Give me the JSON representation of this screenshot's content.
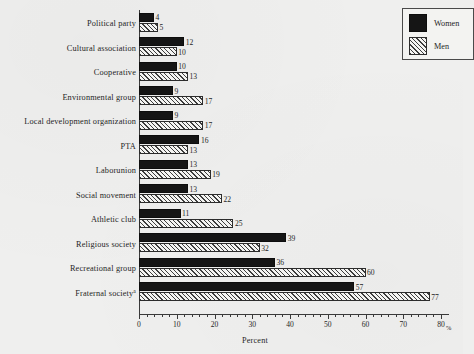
{
  "chart_data": {
    "type": "bar",
    "orientation": "horizontal",
    "title": "",
    "xlabel": "Percent",
    "ylabel": "",
    "xlim": [
      0,
      80
    ],
    "x_unit": "%",
    "grid": false,
    "legend_position": "top-right",
    "xticks": [
      0,
      10,
      20,
      30,
      40,
      50,
      60,
      70,
      80
    ],
    "xtick_labels": [
      "0",
      "10",
      "20",
      "30",
      "40",
      "50",
      "60",
      "70",
      "80"
    ],
    "categories": [
      "Political party",
      "Cultural association",
      "Cooperative",
      "Environmental group",
      "Local development organization",
      "PTA",
      "Laborunion",
      "Social movement",
      "Athletic club",
      "Religious society",
      "Recreational group",
      "Fraternal society"
    ],
    "category_footnote_markers": [
      "",
      "",
      "",
      "",
      "",
      "",
      "",
      "",
      "",
      "",
      "",
      "a"
    ],
    "series": [
      {
        "name": "Women",
        "fill": "solid-black",
        "values": [
          4,
          12,
          10,
          9,
          9,
          16,
          13,
          13,
          11,
          39,
          36,
          57
        ]
      },
      {
        "name": "Men",
        "fill": "diagonal-hatch",
        "values": [
          5,
          10,
          13,
          17,
          17,
          13,
          19,
          22,
          25,
          32,
          60,
          77
        ]
      }
    ]
  },
  "legend": {
    "items": [
      {
        "label": "Women",
        "swatch": "solid-black"
      },
      {
        "label": "Men",
        "swatch": "diagonal-hatch"
      }
    ]
  },
  "colors": {
    "women_bar": "#151515",
    "men_bar_stroke": "#2c2c2c",
    "men_bar_fill": "#f2f2f0",
    "axis": "#3a3a3a",
    "text": "#1f1f1f",
    "background": "#efefee"
  }
}
